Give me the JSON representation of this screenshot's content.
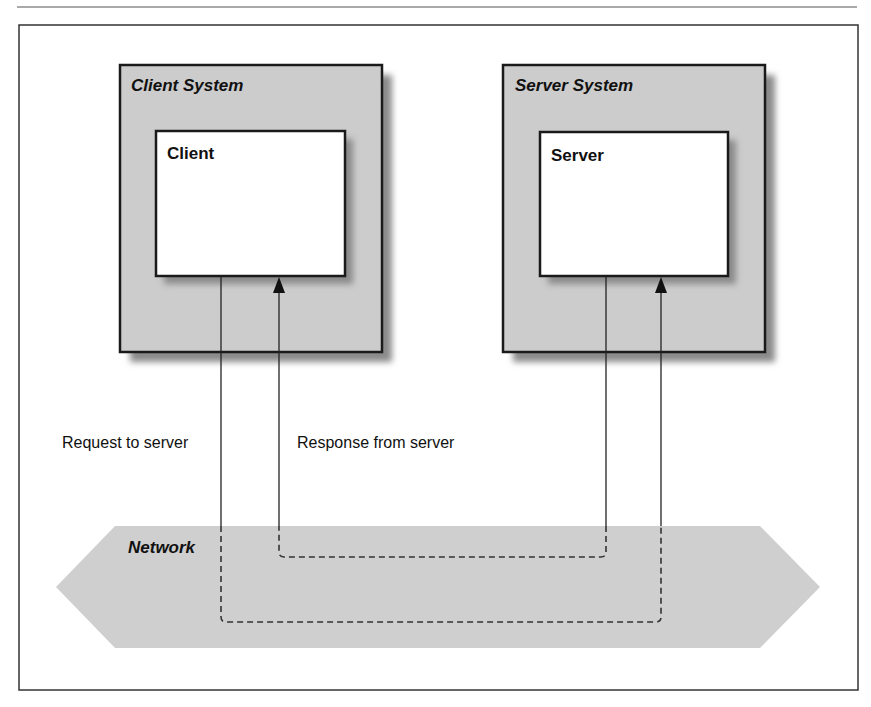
{
  "diagram": {
    "client_system": {
      "label": "Client System",
      "inner_label": "Client"
    },
    "server_system": {
      "label": "Server System",
      "inner_label": "Server"
    },
    "network": {
      "label": "Network"
    },
    "request_label": "Request to server",
    "response_label": "Response from server"
  },
  "colors": {
    "system_fill": "#cccccc",
    "shadow": "#8a8a8a",
    "network_fill": "#cfcfcf",
    "line": "#222222",
    "box_fill": "#ffffff"
  }
}
